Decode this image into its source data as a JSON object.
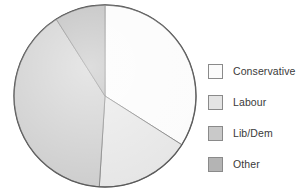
{
  "chart_data": {
    "type": "pie",
    "title": "",
    "categories": [
      "Conservative",
      "Labour",
      "Lib/Dem",
      "Other"
    ],
    "values": [
      34,
      17,
      40,
      9
    ],
    "units": "percent",
    "colors": [
      "#fbfbfb",
      "#e4e4e4",
      "#c9c9c9",
      "#b4b4b4"
    ],
    "start_angle_deg": 0,
    "direction": "clockwise",
    "legend_position": "right",
    "grid": false,
    "labels_on_slices": false,
    "slice_border_color": "#6e6e6e",
    "outline_color": "#555555"
  },
  "legend": {
    "items": [
      {
        "label": "Conservative",
        "color": "#fbfbfb"
      },
      {
        "label": "Labour",
        "color": "#e4e4e4"
      },
      {
        "label": "Lib/Dem",
        "color": "#c9c9c9"
      },
      {
        "label": "Other",
        "color": "#b4b4b4"
      }
    ]
  },
  "geometry": {
    "center_x": 105,
    "center_y": 96,
    "radius": 91
  }
}
